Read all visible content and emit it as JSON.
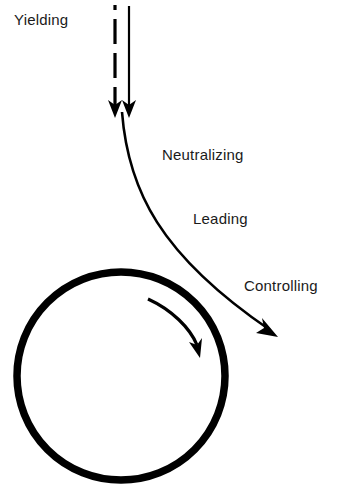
{
  "diagram": {
    "labels": {
      "yielding": "Yielding",
      "neutralizing": "Neutralizing",
      "leading": "Leading",
      "controlling": "Controlling"
    },
    "elements": {
      "dashed_arrow": "incoming force (dashed, downward)",
      "solid_arrow": "incoming force (solid, downward)",
      "deflection_curve": "curved redirected path with arrowhead",
      "circle": "body / circle",
      "rotation_arrow": "clockwise rotation arrow inside circle"
    },
    "colors": {
      "stroke": "#000000",
      "background": "#ffffff",
      "text": "#1a1a1a"
    }
  }
}
